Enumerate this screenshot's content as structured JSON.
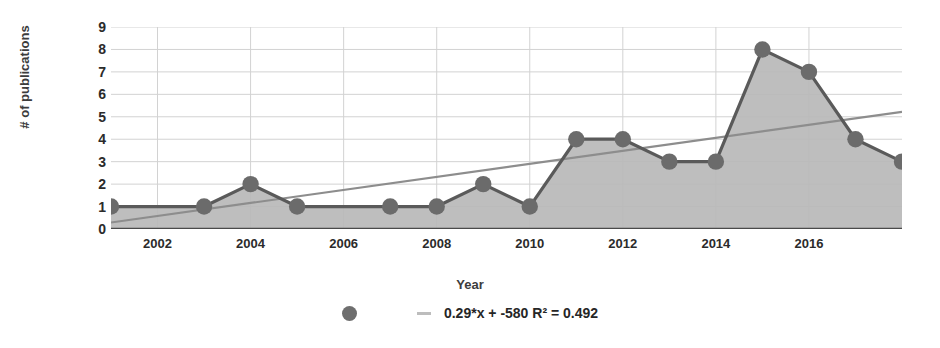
{
  "chart_data": {
    "type": "area",
    "title": "",
    "xlabel": "Year",
    "ylabel": "# of publications",
    "xlim": [
      2001,
      2018
    ],
    "ylim": [
      0,
      9
    ],
    "grid": true,
    "legend_position": "bottom",
    "x_ticks": [
      2002,
      2004,
      2006,
      2008,
      2010,
      2012,
      2014,
      2016
    ],
    "y_ticks": [
      0,
      1,
      2,
      3,
      4,
      5,
      6,
      7,
      8,
      9
    ],
    "x": [
      2001,
      2003,
      2004,
      2005,
      2007,
      2008,
      2009,
      2010,
      2011,
      2012,
      2013,
      2014,
      2015,
      2016,
      2017,
      2018
    ],
    "values": [
      1,
      1,
      2,
      1,
      1,
      1,
      2,
      1,
      4,
      4,
      3,
      3,
      8,
      7,
      4,
      3
    ],
    "series": [
      {
        "name": "# of publications",
        "type": "area",
        "x": [
          2001,
          2003,
          2004,
          2005,
          2007,
          2008,
          2009,
          2010,
          2011,
          2012,
          2013,
          2014,
          2015,
          2016,
          2017,
          2018
        ],
        "values": [
          1,
          1,
          2,
          1,
          1,
          1,
          2,
          1,
          4,
          4,
          3,
          3,
          8,
          7,
          4,
          3
        ],
        "marker": "circle",
        "line_color": "#5a5a5a",
        "fill_color": "#b9b9b9",
        "marker_color": "#6b6b6b"
      },
      {
        "name": "0.29*x + -580 R² = 0.492",
        "type": "line",
        "trendline": true,
        "slope": 0.29,
        "intercept": -580,
        "r_squared": 0.492,
        "x": [
          2001,
          2018
        ],
        "values": [
          0.29,
          5.22
        ],
        "line_color": "#8d8d8d"
      }
    ],
    "annotations": [],
    "colors": {
      "background": "#ffffff",
      "grid": "#d2d2d2",
      "axis": "#4a4a4a",
      "area_fill": "#b9b9b9",
      "series_line": "#5a5a5a",
      "marker": "#6b6b6b",
      "trend_line": "#8d8d8d",
      "text": "#2b2b2b"
    }
  },
  "legend": {
    "entries": [
      {
        "label": "0.29*x + -580 R² = 0.492",
        "marker": "circle-and-dash"
      }
    ]
  },
  "axes": {
    "y_title": "# of publications",
    "x_title": "Year"
  }
}
